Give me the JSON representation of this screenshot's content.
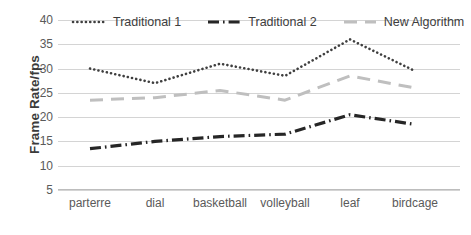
{
  "chart_data": {
    "type": "line",
    "title": "",
    "xlabel": "",
    "ylabel": "Frame Rate/fps",
    "categories": [
      "parterre",
      "dial",
      "basketball",
      "volleyball",
      "leaf",
      "birdcage"
    ],
    "ylim": [
      5,
      40
    ],
    "yticks": [
      5,
      10,
      15,
      20,
      25,
      30,
      35,
      40
    ],
    "grid": true,
    "legend_position": "top",
    "series": [
      {
        "name": "Traditional 1",
        "values": [
          30,
          27,
          31,
          28.5,
          36,
          29.5
        ],
        "color": "#3f3f3f",
        "style": "dotted",
        "swatch": "dotted-line-swatch"
      },
      {
        "name": "Traditional 2",
        "values": [
          13.5,
          15,
          16,
          16.5,
          20.5,
          18.5
        ],
        "color": "#262626",
        "style": "dash-dot",
        "swatch": "dash-dot-line-swatch"
      },
      {
        "name": "New Algorithm",
        "values": [
          23.5,
          24,
          25.5,
          23.5,
          28.5,
          26
        ],
        "color": "#bfbfbf",
        "style": "dashed",
        "swatch": "dashed-line-swatch"
      }
    ]
  },
  "axis": {
    "y_title": "Frame Rate/fps",
    "y_tick_labels": [
      "40",
      "35",
      "30",
      "25",
      "20",
      "15",
      "10",
      "5"
    ],
    "x_tick_labels": [
      "parterre",
      "dial",
      "basketball",
      "volleyball",
      "leaf",
      "birdcage"
    ]
  },
  "legend": {
    "items": [
      {
        "label": "Traditional 1"
      },
      {
        "label": "Traditional 2"
      },
      {
        "label": "New Algorithm"
      }
    ]
  }
}
